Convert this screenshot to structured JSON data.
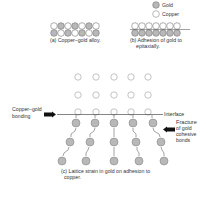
{
  "legend": {
    "gold_label": "Gold",
    "copper_label": "Copper",
    "gold_color": "#b8b8b8",
    "copper_color": "#ffffff"
  },
  "panel_a": {
    "caption": "(a) Copper–gold alloy.",
    "top_row": [
      "copper",
      "gold",
      "copper",
      "gold",
      "copper",
      "gold",
      "copper"
    ],
    "bottom_row": [
      "gold",
      "copper",
      "gold",
      "copper",
      "gold",
      "copper",
      "gold"
    ]
  },
  "panel_b": {
    "caption_line1": "(b) Adhesion of gold to",
    "caption_line2": "epitaxially.",
    "top_row": [
      "copper",
      "copper",
      "copper",
      "copper",
      "copper",
      "copper",
      "copper"
    ],
    "bottom_row": [
      "gold",
      "gold",
      "gold",
      "gold",
      "gold",
      "gold",
      "gold"
    ]
  },
  "panel_c": {
    "label_bonding_line1": "Copper–gold",
    "label_bonding_line2": "bonding",
    "label_interface": "Interface",
    "label_fracture_line1": "Fracture",
    "label_fracture_line2": "of gold",
    "label_fracture_line3": "cohesive",
    "label_fracture_line4": "bonds",
    "caption_line1": "(c) Lattice strain in gold on adhesion to",
    "caption_line2": "copper.",
    "copper_rows": 3,
    "gold_rows": 3,
    "columns": 5
  }
}
